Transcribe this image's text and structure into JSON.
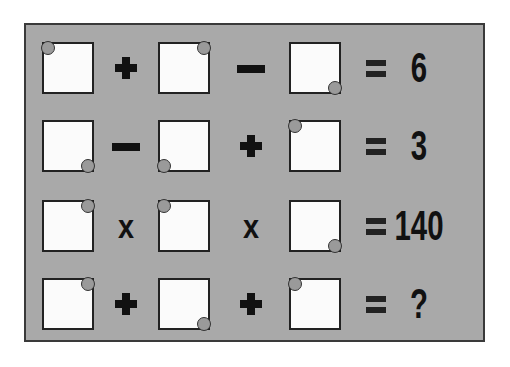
{
  "puzzle": {
    "background_color": "#a9a9a9",
    "box_color": "#fbfbfb",
    "rows": [
      {
        "boxes": [
          {
            "dot": "tl"
          },
          {
            "dot": "tr"
          },
          {
            "dot": "br"
          }
        ],
        "operators": [
          "+",
          "-"
        ],
        "equals": "=",
        "result": "6"
      },
      {
        "boxes": [
          {
            "dot": "br"
          },
          {
            "dot": "bl"
          },
          {
            "dot": "tl"
          }
        ],
        "operators": [
          "-",
          "+"
        ],
        "equals": "=",
        "result": "3"
      },
      {
        "boxes": [
          {
            "dot": "tr"
          },
          {
            "dot": "tl"
          },
          {
            "dot": "br"
          }
        ],
        "operators": [
          "x",
          "x"
        ],
        "equals": "=",
        "result": "140"
      },
      {
        "boxes": [
          {
            "dot": "tr"
          },
          {
            "dot": "br"
          },
          {
            "dot": "tl"
          }
        ],
        "operators": [
          "+",
          "+"
        ],
        "equals": "=",
        "result": "?"
      }
    ]
  }
}
